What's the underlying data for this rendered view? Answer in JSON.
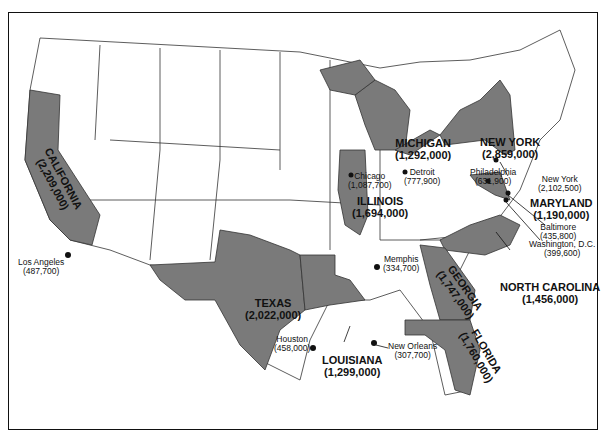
{
  "map": {
    "title": "",
    "fill_highlight": "#7a7a7a",
    "fill_other": "#ffffff",
    "stroke": "#333333",
    "states": [
      {
        "name": "CALIFORNIA",
        "value": "(2,209,000)"
      },
      {
        "name": "TEXAS",
        "value": "(2,022,000)"
      },
      {
        "name": "LOUISIANA",
        "value": "(1,299,000)"
      },
      {
        "name": "ILLINOIS",
        "value": "(1,694,000)"
      },
      {
        "name": "MICHIGAN",
        "value": "(1,292,000)"
      },
      {
        "name": "NEW YORK",
        "value": "(2,859,000)"
      },
      {
        "name": "MARYLAND",
        "value": "(1,190,000)"
      },
      {
        "name": "NORTH CAROLINA",
        "value": "(1,456,000)"
      },
      {
        "name": "GEORGIA",
        "value": "(1,747,000)"
      },
      {
        "name": "FLORIDA",
        "value": "(1,760,000)"
      }
    ],
    "cities": [
      {
        "name": "Los Angeles",
        "value": "(487,700)"
      },
      {
        "name": "Chicago",
        "value": "(1,087,700)"
      },
      {
        "name": "Detroit",
        "value": "(777,900)"
      },
      {
        "name": "Philadelphia",
        "value": "(631,900)"
      },
      {
        "name": "New York",
        "value": "(2,102,500)"
      },
      {
        "name": "Baltimore",
        "value": "(435,800)"
      },
      {
        "name": "Washington, D.C.",
        "value": "(399,600)"
      },
      {
        "name": "Memphis",
        "value": "(334,700)"
      },
      {
        "name": "Houston",
        "value": "(458,000)"
      },
      {
        "name": "New Orleans",
        "value": "(307,700)"
      }
    ]
  }
}
